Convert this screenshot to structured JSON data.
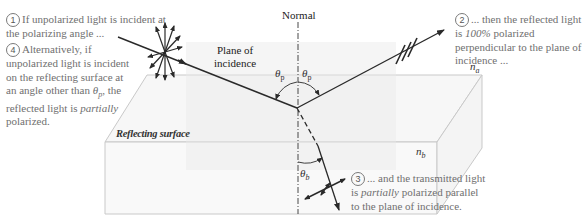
{
  "diagram": {
    "labels": {
      "normal": "Normal",
      "plane_line1": "Plane of",
      "plane_line2": "incidence",
      "reflecting_surface": "Reflecting surface",
      "n_a": "n",
      "n_a_sub": "a",
      "n_b": "n",
      "n_b_sub": "b",
      "theta": "θ",
      "theta_p_sub": "p",
      "theta_b_sub": "b"
    },
    "notes": [
      {
        "number": "1",
        "text": "If unpolarized light is incident at the polarizing angle ..."
      },
      {
        "number": "2",
        "prefix": "... then the reflected light is",
        "emphasis": "100%",
        "suffix": "polarized perpendicular to the plane of incidence ..."
      },
      {
        "number": "3",
        "prefix": "... and the transmitted light is",
        "emphasis": "partially",
        "suffix": "polarized parallel to the plane of incidence."
      },
      {
        "number": "4",
        "prefix": "Alternatively, if unpolarized light is incident on the reflecting surface at an angle other than",
        "symbol": "θ",
        "symbol_sub": "p",
        "middle": ", the reflected light is",
        "emphasis": "partially",
        "suffix": "polarized."
      }
    ],
    "colors": {
      "ray": "#2a2a2a",
      "surface_edge": "#c8c8c8",
      "surface_fill": "#f6f6f6",
      "plane_fill": "#efefef",
      "note_text": "#6f6f6f"
    }
  }
}
